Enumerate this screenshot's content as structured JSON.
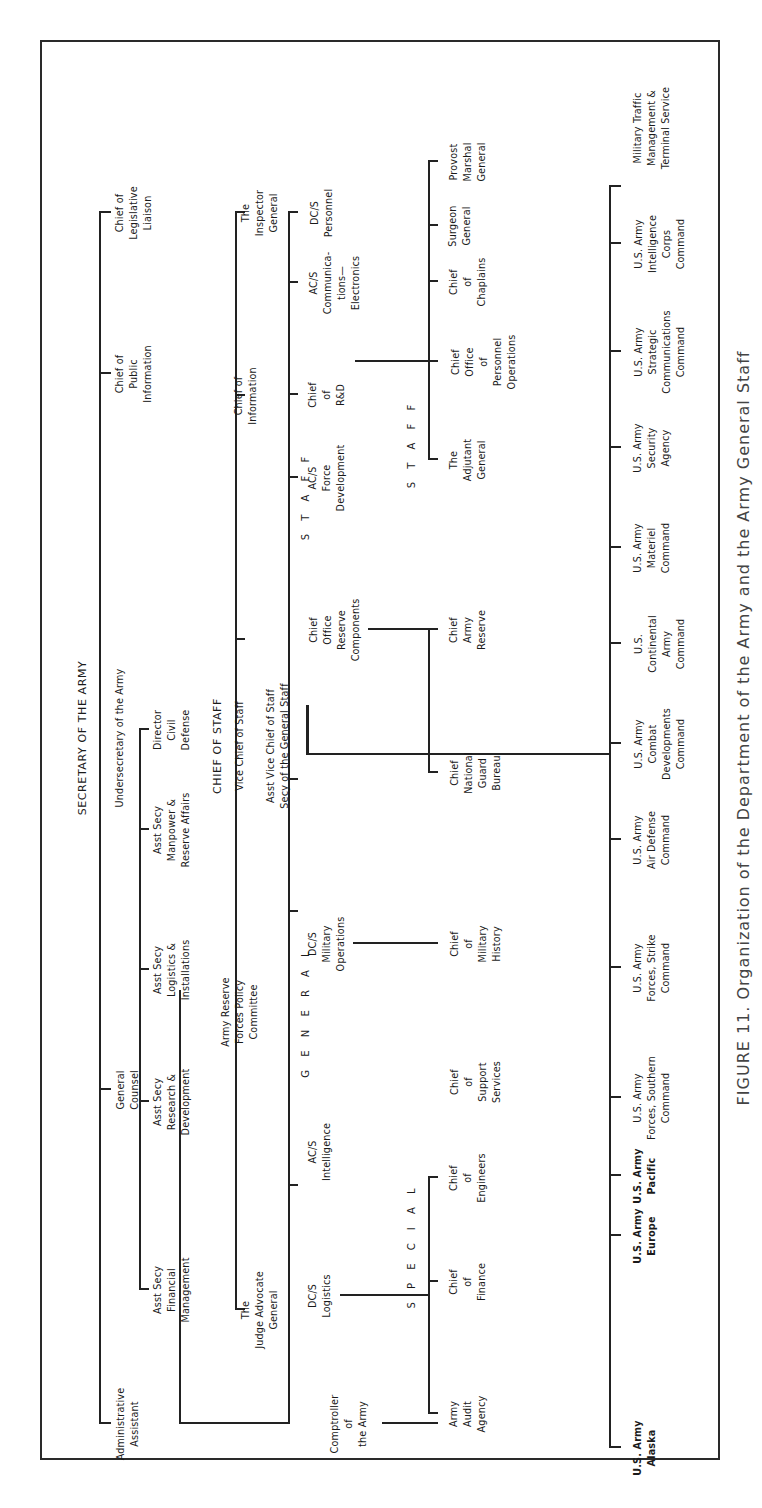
{
  "title": "Organization of the Department of the Army and the Army General Staff",
  "caption": "FIGURE 11. Organization of the Department of the Army and the Army General Staff",
  "chart_data": {
    "type": "org-chart",
    "orientation": "rotated 90deg counter-clockwise",
    "root": "SECRETARY OF THE ARMY",
    "frame": {
      "x": 48,
      "y": 40,
      "w": 1420,
      "h": 680,
      "stroke": 2
    },
    "lines": [
      {
        "x": 84,
        "y": 99,
        "w": 1213,
        "h": 2,
        "name": "secretary-staff-bus"
      },
      {
        "x": 84,
        "y": 99,
        "w": 2,
        "h": 12
      },
      {
        "x": 418,
        "y": 99,
        "w": 2,
        "h": 12
      },
      {
        "x": 1134,
        "y": 99,
        "w": 2,
        "h": 12
      },
      {
        "x": 1295,
        "y": 99,
        "w": 2,
        "h": 12
      },
      {
        "x": 218,
        "y": 139,
        "w": 562,
        "h": 2,
        "name": "asst-secy-bus"
      },
      {
        "x": 218,
        "y": 139,
        "w": 2,
        "h": 10
      },
      {
        "x": 406,
        "y": 139,
        "w": 2,
        "h": 10
      },
      {
        "x": 538,
        "y": 139,
        "w": 2,
        "h": 10
      },
      {
        "x": 678,
        "y": 139,
        "w": 2,
        "h": 10
      },
      {
        "x": 778,
        "y": 139,
        "w": 2,
        "h": 10
      },
      {
        "x": 84,
        "y": 179,
        "w": 2,
        "h": 110,
        "name": "comptroller-link-h"
      },
      {
        "x": 84,
        "y": 179,
        "w": 434,
        "h": 2,
        "name": "secretary-to-general-staff"
      },
      {
        "x": 198,
        "y": 235,
        "w": 1098,
        "h": 2,
        "name": "chief-of-staff-bus"
      },
      {
        "x": 198,
        "y": 235,
        "w": 2,
        "h": 10
      },
      {
        "x": 868,
        "y": 235,
        "w": 2,
        "h": 10
      },
      {
        "x": 1112,
        "y": 235,
        "w": 2,
        "h": 10
      },
      {
        "x": 1295,
        "y": 235,
        "w": 2,
        "h": 10
      },
      {
        "x": 84,
        "y": 288,
        "w": 1213,
        "h": 2,
        "name": "general-staff-bus"
      },
      {
        "x": 84,
        "y": 288,
        "w": 12,
        "h": 2
      },
      {
        "x": 322,
        "y": 288,
        "w": 2,
        "h": 10
      },
      {
        "x": 596,
        "y": 288,
        "w": 2,
        "h": 10
      },
      {
        "x": 728,
        "y": 288,
        "w": 2,
        "h": 10
      },
      {
        "x": 1030,
        "y": 288,
        "w": 2,
        "h": 10
      },
      {
        "x": 1113,
        "y": 288,
        "w": 2,
        "h": 10
      },
      {
        "x": 1225,
        "y": 288,
        "w": 2,
        "h": 10
      },
      {
        "x": 1295,
        "y": 288,
        "w": 2,
        "h": 10
      },
      {
        "x": 753,
        "y": 306,
        "w": 2,
        "h": 304,
        "name": "cos-to-commands"
      },
      {
        "x": 753,
        "y": 306,
        "w": 50,
        "h": 3
      },
      {
        "x": 1146,
        "y": 355,
        "w": 2,
        "h": 75,
        "name": "dcs-personnel-link"
      },
      {
        "x": 1146,
        "y": 428,
        "w": 180,
        "h": 2
      },
      {
        "x": 1048,
        "y": 428,
        "w": 100,
        "h": 2,
        "name": "personnel-bus"
      },
      {
        "x": 1048,
        "y": 428,
        "w": 2,
        "h": 10
      },
      {
        "x": 1146,
        "y": 428,
        "w": 2,
        "h": 10
      },
      {
        "x": 1226,
        "y": 428,
        "w": 2,
        "h": 10
      },
      {
        "x": 1282,
        "y": 428,
        "w": 2,
        "h": 10
      },
      {
        "x": 1346,
        "y": 428,
        "w": 2,
        "h": 10
      },
      {
        "x": 1048,
        "y": 428,
        "w": 300,
        "h": 2
      },
      {
        "x": 878,
        "y": 368,
        "w": 2,
        "h": 60,
        "name": "reserve-components-link"
      },
      {
        "x": 735,
        "y": 428,
        "w": 145,
        "h": 2,
        "name": "reserve-bus"
      },
      {
        "x": 735,
        "y": 428,
        "w": 2,
        "h": 10
      },
      {
        "x": 878,
        "y": 428,
        "w": 2,
        "h": 10
      },
      {
        "x": 564,
        "y": 353,
        "w": 2,
        "h": 75,
        "name": "mil-ops-link"
      },
      {
        "x": 564,
        "y": 428,
        "w": 2,
        "h": 10
      },
      {
        "x": 212,
        "y": 340,
        "w": 2,
        "h": 88,
        "name": "logistics-link"
      },
      {
        "x": 94,
        "y": 428,
        "w": 237,
        "h": 2,
        "name": "special-staff-bus"
      },
      {
        "x": 94,
        "y": 428,
        "w": 2,
        "h": 10
      },
      {
        "x": 226,
        "y": 428,
        "w": 2,
        "h": 10
      },
      {
        "x": 330,
        "y": 428,
        "w": 2,
        "h": 10
      },
      {
        "x": 84,
        "y": 382,
        "w": 2,
        "h": 48,
        "name": "comptroller-link"
      },
      {
        "x": 84,
        "y": 428,
        "w": 2,
        "h": 10
      },
      {
        "x": 60,
        "y": 609,
        "w": 1263,
        "h": 2,
        "name": "commands-bus"
      },
      {
        "x": 60,
        "y": 609,
        "w": 2,
        "h": 12
      },
      {
        "x": 272,
        "y": 609,
        "w": 2,
        "h": 12
      },
      {
        "x": 332,
        "y": 609,
        "w": 2,
        "h": 12
      },
      {
        "x": 410,
        "y": 609,
        "w": 2,
        "h": 12
      },
      {
        "x": 540,
        "y": 609,
        "w": 2,
        "h": 12
      },
      {
        "x": 668,
        "y": 609,
        "w": 2,
        "h": 12
      },
      {
        "x": 764,
        "y": 609,
        "w": 2,
        "h": 12
      },
      {
        "x": 864,
        "y": 609,
        "w": 2,
        "h": 12
      },
      {
        "x": 960,
        "y": 609,
        "w": 2,
        "h": 12
      },
      {
        "x": 1060,
        "y": 609,
        "w": 2,
        "h": 12
      },
      {
        "x": 1156,
        "y": 609,
        "w": 2,
        "h": 12
      },
      {
        "x": 1264,
        "y": 609,
        "w": 2,
        "h": 12
      },
      {
        "x": 1321,
        "y": 609,
        "w": 2,
        "h": 12
      }
    ],
    "nodes": [
      {
        "id": "secretary",
        "text": "SECRETARY OF THE ARMY",
        "x": 770,
        "y": 83,
        "style": "head"
      },
      {
        "id": "undersecretary",
        "text": "Undersecretary of the Army",
        "x": 770,
        "y": 120
      },
      {
        "id": "asst-secy-fm",
        "text": "Asst Secy\nFinancial\nManagement",
        "x": 218,
        "y": 172
      },
      {
        "id": "asst-secy-rd",
        "text": "Asst Secy\nResearch &\nDevelopment",
        "x": 406,
        "y": 172
      },
      {
        "id": "asst-secy-li",
        "text": "Asst Secy\nLogistics &\nInstallations",
        "x": 538,
        "y": 172
      },
      {
        "id": "asst-secy-mra",
        "text": "Asst Secy\nManpower &\nReserve Affairs",
        "x": 678,
        "y": 172
      },
      {
        "id": "director-civil-defense",
        "text": "Director\nCivil\nDefense",
        "x": 778,
        "y": 172
      },
      {
        "id": "administrative-assistant",
        "text": "Administrative\nAssistant",
        "x": 84,
        "y": 128
      },
      {
        "id": "general-counsel",
        "text": "General\nCounsel",
        "x": 418,
        "y": 128
      },
      {
        "id": "chief-public-information",
        "text": "Chief of\nPublic\nInformation",
        "x": 1134,
        "y": 134
      },
      {
        "id": "chief-legislative-liaison",
        "text": "Chief of\nLegislative\nLiaison",
        "x": 1295,
        "y": 134
      },
      {
        "id": "chief-of-staff",
        "text": "CHIEF OF STAFF",
        "x": 762,
        "y": 218,
        "style": "head"
      },
      {
        "id": "vice-chief",
        "text": "Vice Chief of Staff",
        "x": 762,
        "y": 240
      },
      {
        "id": "asst-vice-chief",
        "text": "Asst Vice Chief of Staff\nSecy of the General Staff",
        "x": 762,
        "y": 278
      },
      {
        "id": "judge-advocate-general",
        "text": "The\nJudge Advocate\nGeneral",
        "x": 198,
        "y": 260
      },
      {
        "id": "army-reserve-forces-policy",
        "text": "Army Reserve\nForces Policy\nCommittee",
        "x": 496,
        "y": 240
      },
      {
        "id": "chief-of-information",
        "text": "Chief of\nInformation",
        "x": 1112,
        "y": 246
      },
      {
        "id": "inspector-general",
        "text": "The\nInspector\nGeneral",
        "x": 1295,
        "y": 260
      },
      {
        "id": "general-label",
        "text": "G E N E R A L",
        "x": 496,
        "y": 306,
        "style": "spaced"
      },
      {
        "id": "staff-label",
        "text": "S T A F F",
        "x": 1012,
        "y": 306,
        "style": "spaced"
      },
      {
        "id": "comptroller",
        "text": "Comptroller\nof\nthe Army",
        "x": 84,
        "y": 349
      },
      {
        "id": "dcs-logistics",
        "text": "DC/S\nLogistics",
        "x": 212,
        "y": 320
      },
      {
        "id": "acs-intelligence",
        "text": "AC/S\nIntelligence",
        "x": 356,
        "y": 320
      },
      {
        "id": "dcs-military-operations",
        "text": "DC/S\nMilitary\nOperations",
        "x": 564,
        "y": 327
      },
      {
        "id": "chief-office-reserve-components",
        "text": "Chief\nOffice\nReserve\nComponents",
        "x": 878,
        "y": 335
      },
      {
        "id": "acs-force-development",
        "text": "AC/S\nForce\nDevelopment",
        "x": 1030,
        "y": 327
      },
      {
        "id": "chief-rd",
        "text": "Chief\nof\nR&D",
        "x": 1113,
        "y": 327
      },
      {
        "id": "acs-communications-electronics",
        "text": "AC/S\nCommunica-\ntions—\nElectronics",
        "x": 1225,
        "y": 335
      },
      {
        "id": "dcs-personnel",
        "text": "DC/S\nPersonnel",
        "x": 1295,
        "y": 322
      },
      {
        "id": "special-label",
        "text": "S P E C I A L",
        "x": 262,
        "y": 412,
        "style": "spaced"
      },
      {
        "id": "staff-label-2",
        "text": "S T A F F",
        "x": 1064,
        "y": 412,
        "style": "spaced"
      },
      {
        "id": "army-audit-agency",
        "text": "Army\nAudit\nAgency",
        "x": 94,
        "y": 468
      },
      {
        "id": "chief-of-finance",
        "text": "Chief\nof\nFinance",
        "x": 226,
        "y": 468
      },
      {
        "id": "chief-of-engineers",
        "text": "Chief\nof\nEngineers",
        "x": 330,
        "y": 468
      },
      {
        "id": "chief-support-services",
        "text": "Chief\nof\nSupport\nServices",
        "x": 426,
        "y": 476
      },
      {
        "id": "chief-military-history",
        "text": "Chief\nof\nMilitary\nHistory",
        "x": 564,
        "y": 476
      },
      {
        "id": "chief-national-guard-bureau",
        "text": "Chief\nNational\nGuard\nBureau",
        "x": 735,
        "y": 476
      },
      {
        "id": "chief-army-reserve",
        "text": "Chief\nArmy\nReserve",
        "x": 878,
        "y": 468
      },
      {
        "id": "adjutant-general",
        "text": "The\nAdjutant\nGeneral",
        "x": 1048,
        "y": 468
      },
      {
        "id": "chief-office-personnel-operations",
        "text": "Chief\nOffice\nof\nPersonnel\nOperations",
        "x": 1146,
        "y": 484
      },
      {
        "id": "chief-of-chaplains",
        "text": "Chief\nof\nChaplains",
        "x": 1226,
        "y": 468
      },
      {
        "id": "surgeon-general",
        "text": "Surgeon\nGeneral",
        "x": 1282,
        "y": 460
      },
      {
        "id": "provost-marshal-general",
        "text": "Provost\nMarshal\nGeneral",
        "x": 1346,
        "y": 468
      },
      {
        "id": "usa-alaska",
        "text": "U.S. Army\nAlaska",
        "x": 60,
        "y": 645,
        "style": "bold"
      },
      {
        "id": "usa-europe",
        "text": "U.S. Army\nEurope",
        "x": 272,
        "y": 645,
        "style": "bold"
      },
      {
        "id": "usa-pacific",
        "text": "U.S. Army\nPacific",
        "x": 332,
        "y": 645,
        "style": "bold"
      },
      {
        "id": "usa-forces-southern",
        "text": "U.S. Army\nForces, Southern\nCommand",
        "x": 410,
        "y": 652
      },
      {
        "id": "usa-forces-strike",
        "text": "U.S. Army\nForces, Strike\nCommand",
        "x": 540,
        "y": 652
      },
      {
        "id": "usa-air-defense",
        "text": "U.S. Army\nAir Defense\nCommand",
        "x": 668,
        "y": 652
      },
      {
        "id": "usa-combat-developments",
        "text": "U.S. Army\nCombat\nDevelopments\nCommand",
        "x": 764,
        "y": 660
      },
      {
        "id": "us-continental-army",
        "text": "U.S.\nContinental\nArmy\nCommand",
        "x": 864,
        "y": 660
      },
      {
        "id": "usa-materiel",
        "text": "U.S. Army\nMateriel\nCommand",
        "x": 960,
        "y": 652
      },
      {
        "id": "usa-security-agency",
        "text": "U.S. Army\nSecurity\nAgency",
        "x": 1060,
        "y": 652
      },
      {
        "id": "usa-strategic-communications",
        "text": "U.S. Army\nStrategic\nCommunications\nCommand",
        "x": 1156,
        "y": 660
      },
      {
        "id": "usa-intelligence-corps",
        "text": "U.S. Army\nIntelligence\nCorps\nCommand",
        "x": 1264,
        "y": 660
      },
      {
        "id": "military-traffic-management",
        "text": "Military Traffic\nManagement &\nTerminal Service",
        "x": 1380,
        "y": 652
      }
    ]
  }
}
